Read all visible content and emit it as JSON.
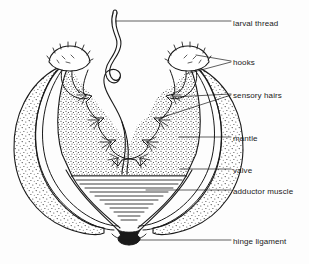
{
  "figure": {
    "background_color": "#fdfdfd",
    "ink_color": "#1a1a1a",
    "width": 309,
    "height": 264
  },
  "labels": [
    {
      "id": "larval-thread",
      "text": "larval thread",
      "x": 233,
      "y": 24,
      "leader_to": "thread-shaft"
    },
    {
      "id": "hooks",
      "text": "hooks",
      "x": 233,
      "y": 63,
      "leader_to": "both-hooks"
    },
    {
      "id": "sensory-hairs",
      "text": "sensory hairs",
      "x": 233,
      "y": 96,
      "leader_to": "hair-tufts"
    },
    {
      "id": "mantle",
      "text": "mantle",
      "x": 233,
      "y": 139,
      "leader_to": "mantle-band"
    },
    {
      "id": "valve",
      "text": "valve",
      "x": 233,
      "y": 171,
      "leader_to": "right-valve"
    },
    {
      "id": "adductor-muscle",
      "text": "adductor muscle",
      "x": 233,
      "y": 192,
      "leader_to": "muscle-striations"
    },
    {
      "id": "hinge-ligament",
      "text": "hinge ligament",
      "x": 233,
      "y": 242,
      "leader_to": "hinge-mass"
    }
  ],
  "parts": {
    "larval_thread": "wavy filament with a single loop, rising from the mantle cavity",
    "hooks": "two toothed hook crowns at the upper inner margins of the valves",
    "sensory_hairs": "fine bristle tufts along the inner mantle margin",
    "mantle": "stippled tissue band lining the inside of both valves",
    "valve": "two stippled shell halves forming the rounded bivalve outline",
    "adductor_muscle": "triangular bundle of horizontal striations between the valves",
    "hinge_ligament": "dark filled wedge joining the valves at the base"
  },
  "counts": {
    "adductor_striations": 12,
    "hooks": 2,
    "valves": 2
  }
}
